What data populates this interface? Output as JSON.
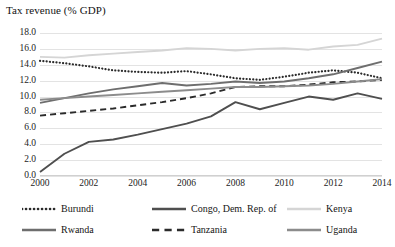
{
  "chart_data": {
    "type": "line",
    "title": "Tax revenue (% GDP)",
    "xlabel": "",
    "ylabel": "",
    "grid": true,
    "legend_position": "bottom",
    "xlim": [
      2000,
      2014
    ],
    "ylim": [
      0.0,
      18.0
    ],
    "ytick_step": 2.0,
    "xtick_step": 2,
    "x": [
      2000,
      2001,
      2002,
      2003,
      2004,
      2005,
      2006,
      2007,
      2008,
      2009,
      2010,
      2011,
      2012,
      2013,
      2014
    ],
    "xticklabels": [
      "2000",
      "2002",
      "2004",
      "2006",
      "2008",
      "2010",
      "2012",
      "2014"
    ],
    "yticklabels": [
      "0.0",
      "2.0",
      "4.0",
      "6.0",
      "8.0",
      "10.0",
      "12.0",
      "14.0",
      "16.0",
      "18.0"
    ],
    "series": [
      {
        "name": "Burundi",
        "style": "dotted",
        "color": "#2b2b2b",
        "values": [
          14.5,
          14.2,
          13.8,
          13.3,
          13.1,
          13.0,
          13.2,
          12.8,
          12.3,
          12.1,
          12.5,
          13.0,
          13.3,
          13.0,
          12.3
        ]
      },
      {
        "name": "Congo, Dem. Rep. of",
        "style": "solid",
        "color": "#4f4f4f",
        "values": [
          0.5,
          2.8,
          4.3,
          4.6,
          5.2,
          5.9,
          6.6,
          7.5,
          9.3,
          8.4,
          9.2,
          10.0,
          9.6,
          10.4,
          9.7
        ]
      },
      {
        "name": "Kenya",
        "style": "solid",
        "color": "#d5d5d5",
        "values": [
          15.0,
          14.9,
          15.2,
          15.4,
          15.6,
          15.8,
          16.1,
          16.0,
          15.8,
          16.0,
          16.1,
          15.9,
          16.3,
          16.5,
          17.3
        ]
      },
      {
        "name": "Rwanda",
        "style": "solid",
        "color": "#6e6e6e",
        "values": [
          9.2,
          9.8,
          10.4,
          10.9,
          11.3,
          11.7,
          11.4,
          11.6,
          11.9,
          11.7,
          11.9,
          12.3,
          12.8,
          13.6,
          14.4
        ]
      },
      {
        "name": "Tanzania",
        "style": "dashed",
        "color": "#2b2b2b",
        "values": [
          7.6,
          7.9,
          8.2,
          8.5,
          8.9,
          9.3,
          9.8,
          10.4,
          11.2,
          11.3,
          11.3,
          11.5,
          11.8,
          11.9,
          12.1
        ]
      },
      {
        "name": "Uganda",
        "style": "solid",
        "color": "#8c8c8c",
        "values": [
          9.6,
          9.8,
          10.0,
          10.2,
          10.4,
          10.6,
          10.8,
          11.0,
          11.2,
          11.2,
          11.3,
          11.4,
          11.6,
          11.9,
          12.2
        ]
      }
    ]
  }
}
